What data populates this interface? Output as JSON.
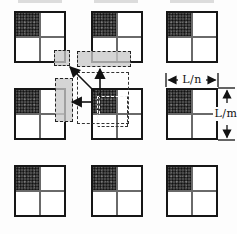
{
  "diagram": {
    "kind": "periodic-microstructure-figure",
    "dimension_labels": {
      "cell_width": "L/n",
      "cell_height": "L/m"
    },
    "grid": {
      "rows": 3,
      "cols": 3,
      "shaded_quadrant": "top-left"
    },
    "arrow_directions": [
      "up",
      "left",
      "up-left-diagonal"
    ],
    "shaded_target_regions": [
      "corner-junction",
      "horizontal-above-center",
      "vertical-left-of-center"
    ],
    "colors": {
      "inclusion_fill": "#4a4a4a",
      "target_fill": "#c9c9c9",
      "line": "#111111",
      "background": "#fdfdfd"
    }
  }
}
